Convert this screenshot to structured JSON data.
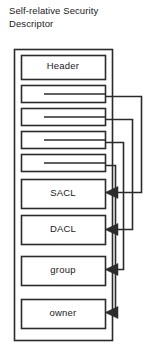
{
  "figure": {
    "title": "Self-relative  Security\nDescriptor",
    "width": 149,
    "height": 353,
    "stroke_color": "#2b2b2b",
    "text_color": "#1a1a1a",
    "background_color": "#ffffff"
  },
  "outer_frame": {
    "name": "security-descriptor-container",
    "x": 14,
    "y": 49,
    "width": 98,
    "height": 291
  },
  "boxes": [
    {
      "label": "Header",
      "name": "header-field",
      "x": 21,
      "y": 55,
      "width": 84,
      "height": 24,
      "has_pointer": false
    },
    {
      "label": "",
      "name": "sacl-offset-field",
      "x": 21,
      "y": 85,
      "width": 84,
      "height": 17,
      "has_pointer": true
    },
    {
      "label": "",
      "name": "dacl-offset-field",
      "x": 21,
      "y": 108,
      "width": 84,
      "height": 17,
      "has_pointer": true
    },
    {
      "label": "",
      "name": "group-offset-field",
      "x": 21,
      "y": 131,
      "width": 84,
      "height": 17,
      "has_pointer": true
    },
    {
      "label": "",
      "name": "owner-offset-field",
      "x": 21,
      "y": 154,
      "width": 84,
      "height": 17,
      "has_pointer": true
    },
    {
      "label": "SACL",
      "name": "sacl-block",
      "x": 21,
      "y": 179,
      "width": 84,
      "height": 29,
      "has_pointer": false
    },
    {
      "label": "DACL",
      "name": "dacl-block",
      "x": 21,
      "y": 215,
      "width": 84,
      "height": 29,
      "has_pointer": false
    },
    {
      "label": "group",
      "name": "group-block",
      "x": 21,
      "y": 256,
      "width": 84,
      "height": 29,
      "has_pointer": false
    },
    {
      "label": "owner",
      "name": "owner-block",
      "x": 21,
      "y": 299,
      "width": 84,
      "height": 29,
      "has_pointer": false
    }
  ],
  "connectors": [
    {
      "name": "connector-sacl",
      "from_label": "sacl-offset-field",
      "to_label": "sacl-block",
      "start_x": 60,
      "start_y": 96,
      "lane_x": 141,
      "end_y": 192
    },
    {
      "name": "connector-dacl",
      "from_label": "dacl-offset-field",
      "to_label": "dacl-block",
      "start_x": 60,
      "start_y": 119,
      "lane_x": 132,
      "end_y": 229
    },
    {
      "name": "connector-group",
      "from_label": "group-offset-field",
      "to_label": "group-block",
      "start_x": 60,
      "start_y": 142,
      "lane_x": 123,
      "end_y": 269
    },
    {
      "name": "connector-owner",
      "from_label": "owner-offset-field",
      "to_label": "owner-block",
      "start_x": 60,
      "start_y": 165,
      "lane_x": 115,
      "end_y": 312
    }
  ],
  "arrow": {
    "head_length": 13,
    "head_half_width": 6,
    "target_x": 105
  }
}
